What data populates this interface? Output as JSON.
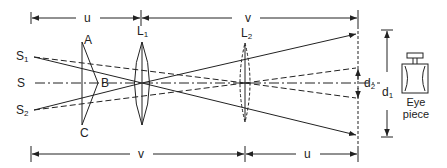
{
  "diagram": {
    "sources": {
      "s1": {
        "label": "S",
        "sub": "1"
      },
      "s": {
        "label": "S",
        "sub": ""
      },
      "s2": {
        "label": "S",
        "sub": "2"
      }
    },
    "biprism": {
      "a": "A",
      "b": "B",
      "c": "C"
    },
    "lenses": {
      "l1": {
        "label": "L",
        "sub": "1"
      },
      "l2": {
        "label": "L",
        "sub": "2"
      }
    },
    "dimensions": {
      "top_u": "u",
      "top_v": "v",
      "bottom_v": "v",
      "bottom_u": "u",
      "d1": {
        "label": "d",
        "sub": "1"
      },
      "d2": {
        "label": "d",
        "sub": "2"
      }
    },
    "eyepiece": {
      "line1": "Eye",
      "line2": "piece"
    },
    "colors": {
      "stroke": "#222222",
      "background": "#ffffff"
    }
  }
}
